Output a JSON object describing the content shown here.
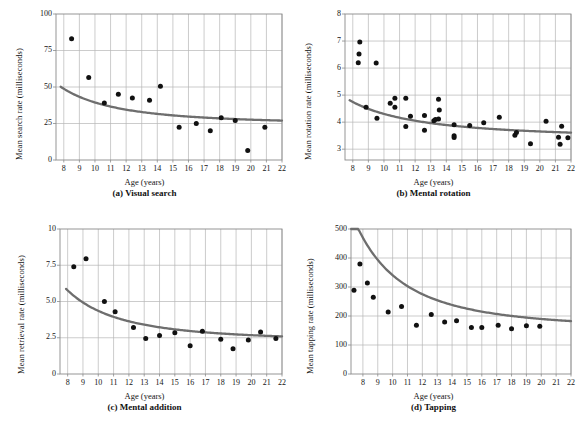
{
  "figure": {
    "background": "#ffffff",
    "point_color": "#111111",
    "curve_color": "#6e6e6e",
    "grid_color": "#b6b6b6",
    "frame_color": "#8a8a8a"
  },
  "chart_data": [
    {
      "id": "a",
      "type": "scatter",
      "title": "(a) Visual search",
      "xlabel": "Age (years)",
      "ylabel": "Mean search rate (milliseconds)",
      "xlim": [
        7.5,
        22
      ],
      "ylim": [
        0,
        100
      ],
      "xticks": [
        8,
        9,
        10,
        11,
        12,
        13,
        14,
        15,
        16,
        17,
        18,
        19,
        20,
        21,
        22
      ],
      "yticks": [
        0,
        25,
        50,
        75,
        100
      ],
      "grid": true,
      "legend": "none",
      "points": [
        [
          8.5,
          83
        ],
        [
          9.6,
          56.5
        ],
        [
          10.6,
          39
        ],
        [
          11.5,
          45
        ],
        [
          12.4,
          42.5
        ],
        [
          13.5,
          41
        ],
        [
          14.2,
          50.5
        ],
        [
          15.4,
          22.5
        ],
        [
          16.5,
          25
        ],
        [
          17.4,
          20
        ],
        [
          18.1,
          29
        ],
        [
          19.0,
          27
        ],
        [
          19.8,
          6.5
        ],
        [
          20.9,
          22.5
        ]
      ],
      "fit_curve": {
        "form": "power",
        "description": "decreasing power curve asymptoting near 24",
        "a": 24.2,
        "b": 2150,
        "c": 2.15,
        "x_start": 7.8,
        "x_end": 22
      }
    },
    {
      "id": "b",
      "type": "scatter",
      "title": "(b) Mental rotation",
      "xlabel": "Age (years)",
      "ylabel": "Mean rotation rate (milliseconds)",
      "xlim": [
        7.5,
        22
      ],
      "ylim": [
        2.6,
        8
      ],
      "xticks": [
        8,
        9,
        10,
        11,
        12,
        13,
        14,
        15,
        16,
        17,
        18,
        19,
        20,
        21,
        22
      ],
      "yticks": [
        3,
        4,
        5,
        6,
        7,
        8
      ],
      "grid": true,
      "legend": "none",
      "points": [
        [
          8.45,
          6.96
        ],
        [
          8.4,
          6.52
        ],
        [
          8.35,
          6.2
        ],
        [
          9.5,
          6.19
        ],
        [
          8.85,
          4.55
        ],
        [
          9.55,
          4.14
        ],
        [
          10.4,
          4.7
        ],
        [
          10.7,
          4.88
        ],
        [
          10.7,
          4.55
        ],
        [
          11.4,
          4.88
        ],
        [
          11.4,
          3.84
        ],
        [
          11.7,
          4.22
        ],
        [
          12.6,
          4.25
        ],
        [
          12.6,
          3.7
        ],
        [
          13.3,
          4.1
        ],
        [
          13.2,
          4.05
        ],
        [
          13.5,
          4.85
        ],
        [
          13.55,
          4.45
        ],
        [
          13.5,
          4.12
        ],
        [
          14.5,
          3.9
        ],
        [
          14.5,
          3.5
        ],
        [
          14.5,
          3.43
        ],
        [
          15.5,
          3.88
        ],
        [
          16.4,
          3.98
        ],
        [
          17.4,
          4.18
        ],
        [
          18.4,
          3.52
        ],
        [
          18.5,
          3.62
        ],
        [
          19.4,
          3.2
        ],
        [
          20.4,
          4.03
        ],
        [
          21.2,
          3.44
        ],
        [
          21.3,
          3.18
        ],
        [
          21.4,
          3.85
        ],
        [
          21.8,
          3.42
        ]
      ],
      "fit_curve": {
        "form": "power",
        "description": "decreasing power curve asymptoting near 3.4",
        "a": 3.38,
        "b": 52,
        "c": 1.75,
        "x_start": 7.8,
        "x_end": 22
      }
    },
    {
      "id": "c",
      "type": "scatter",
      "title": "(c) Mental addition",
      "xlabel": "Age (years)",
      "ylabel": "Mean retrieval rate (milliseconds)",
      "xlim": [
        7.5,
        22
      ],
      "ylim": [
        0,
        10
      ],
      "xticks": [
        8,
        9,
        10,
        11,
        12,
        13,
        14,
        15,
        16,
        17,
        18,
        19,
        20,
        21,
        22
      ],
      "yticks": [
        "0",
        "2.5",
        "5.0",
        "7.5",
        "10"
      ],
      "ytickvals": [
        0,
        2.5,
        5,
        7.5,
        10
      ],
      "grid": true,
      "legend": "none",
      "points": [
        [
          8.4,
          7.4
        ],
        [
          9.2,
          7.95
        ],
        [
          10.4,
          5.0
        ],
        [
          11.1,
          4.3
        ],
        [
          12.3,
          3.2
        ],
        [
          13.1,
          2.45
        ],
        [
          14.0,
          2.65
        ],
        [
          15.0,
          2.85
        ],
        [
          16.0,
          1.95
        ],
        [
          16.8,
          2.95
        ],
        [
          18.0,
          2.4
        ],
        [
          18.8,
          1.75
        ],
        [
          19.8,
          2.35
        ],
        [
          20.6,
          2.9
        ],
        [
          21.6,
          2.45
        ]
      ],
      "fit_curve": {
        "form": "power",
        "description": "decreasing power curve asymptoting near 2.3",
        "a": 2.25,
        "b": 420,
        "c": 2.3,
        "x_start": 7.9,
        "x_end": 22
      }
    },
    {
      "id": "d",
      "type": "scatter",
      "title": "(d) Tapping",
      "xlabel": "Age (years)",
      "ylabel": "Mean tapping rate (milliseconds)",
      "xlim": [
        7.2,
        22
      ],
      "ylim": [
        0,
        500
      ],
      "xticks": [
        8,
        9,
        10,
        11,
        12,
        13,
        14,
        15,
        16,
        17,
        18,
        19,
        20,
        21,
        22
      ],
      "yticks": [
        0,
        100,
        200,
        300,
        400,
        500
      ],
      "grid": true,
      "legend": "none",
      "points": [
        [
          7.4,
          289
        ],
        [
          7.8,
          379
        ],
        [
          8.3,
          314
        ],
        [
          8.7,
          265
        ],
        [
          9.7,
          214
        ],
        [
          10.6,
          233
        ],
        [
          11.6,
          168
        ],
        [
          12.6,
          205
        ],
        [
          13.5,
          179
        ],
        [
          14.3,
          184
        ],
        [
          15.3,
          160
        ],
        [
          16.0,
          160
        ],
        [
          17.1,
          168
        ],
        [
          18.0,
          156
        ],
        [
          19.0,
          166
        ],
        [
          19.9,
          165
        ]
      ],
      "fit_curve": {
        "form": "power",
        "description": "decreasing power curve asymptoting near 155",
        "a": 153,
        "b": 42000,
        "c": 2.35,
        "x_start": 7.2,
        "x_end": 22
      }
    }
  ]
}
